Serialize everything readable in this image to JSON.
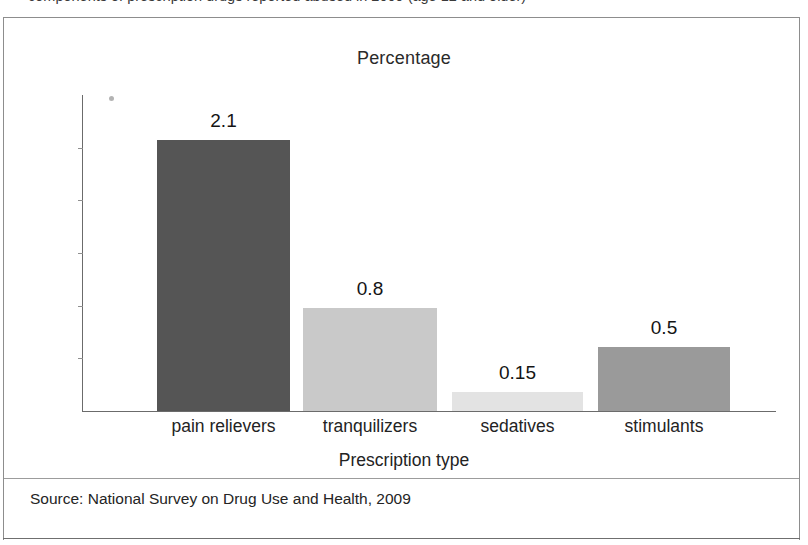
{
  "page": {
    "cropped_caption_sliver": "components of prescription drugs reported abused in 2009 (age 12 and older)"
  },
  "figure": {
    "title": "Percentage",
    "axis_title": "Prescription type",
    "source": "Source: National Survey on Drug Use and Health, 2009"
  },
  "chart_data": {
    "type": "bar",
    "title": "Percentage",
    "xlabel": "Prescription type",
    "ylabel": "Percentage",
    "categories": [
      "pain relievers",
      "tranquilizers",
      "sedatives",
      "stimulants"
    ],
    "values": [
      2.1,
      0.8,
      0.15,
      0.5
    ],
    "value_labels": [
      "2.1",
      "0.8",
      "0.15",
      "0.5"
    ],
    "bar_colors": [
      "#555555",
      "#c9c9c9",
      "#e3e3e3",
      "#9a9a9a"
    ],
    "ylim": [
      0,
      2.45
    ],
    "grid": false,
    "legend": false,
    "y_axis_tick_labels_shown": false,
    "y_tick_count": 5,
    "source": "Source: National Survey on Drug Use and Health, 2009"
  },
  "colors": {
    "frame_border": "#8d8d8d",
    "axis_line": "#6b6b6b",
    "text": "#232323",
    "bar_dark": "#555555",
    "bar_light": "#c9c9c9",
    "bar_lightest": "#e3e3e3",
    "bar_medium": "#9a9a9a"
  }
}
